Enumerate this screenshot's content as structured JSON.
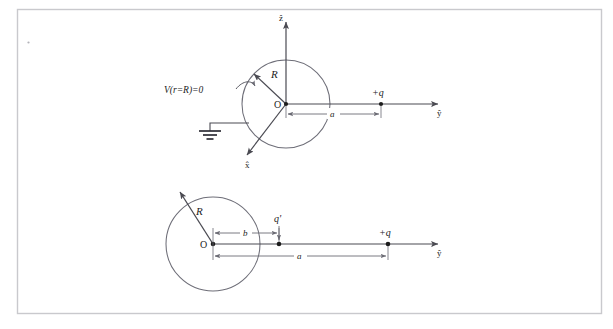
{
  "page": {
    "background_color": "#ffffff",
    "frame_color": "#c9c9cd",
    "stroke_color": "#4a4a52",
    "ink_color": "#1c1c1c",
    "width": 613,
    "height": 329
  },
  "figure": {
    "title_hidden": "Method of images for a grounded conducting sphere",
    "panels": [
      {
        "id": "panel-top",
        "name": "grounded-sphere-with-external-charge",
        "circle": {
          "cx": 286,
          "cy": 104,
          "r": 44
        },
        "origin_label": "O",
        "radius_label": "R",
        "axis_vertical_label": "ẑ",
        "axis_horizontal_label": "ŷ",
        "axis_diagonal_label": "x̂",
        "boundary_condition_label": "V(r=R)=0",
        "ground_symbol": "earth-ground",
        "charge_label": "+q",
        "distance_label": "a"
      },
      {
        "id": "panel-bottom",
        "name": "image-charge-configuration",
        "circle": {
          "cx": 213,
          "cy": 244,
          "r": 47
        },
        "origin_label": "O",
        "radius_label": "R",
        "axis_horizontal_label": "ŷ",
        "image_charge_label": "q'",
        "image_distance_label": "b",
        "charge_label": "+q",
        "distance_label": "a"
      }
    ]
  }
}
